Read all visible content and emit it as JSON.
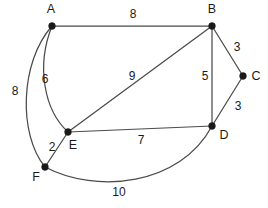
{
  "figure": {
    "type": "undirected-weighted-graph",
    "width": 268,
    "height": 208,
    "background_color": "#ffffff",
    "edge_color": "#4a4a4a",
    "node_color": "#1a1a1a",
    "label_color": "#1a1a1a"
  },
  "nodes": [
    {
      "id": "A",
      "label": "A",
      "cx": 52,
      "cy": 26,
      "label_x": 51,
      "label_y": 10
    },
    {
      "id": "B",
      "label": "B",
      "cx": 212,
      "cy": 26,
      "label_x": 212,
      "label_y": 10
    },
    {
      "id": "C",
      "label": "C",
      "cx": 243,
      "cy": 76,
      "label_x": 256,
      "label_y": 77
    },
    {
      "id": "D",
      "label": "D",
      "cx": 212,
      "cy": 126,
      "label_x": 224,
      "label_y": 136
    },
    {
      "id": "E",
      "label": "E",
      "cx": 68,
      "cy": 132,
      "label_x": 73,
      "label_y": 146
    },
    {
      "id": "F",
      "label": "F",
      "cx": 45,
      "cy": 167,
      "label_x": 36,
      "label_y": 178
    }
  ],
  "edges": [
    {
      "from": "A",
      "to": "B",
      "weight": "8",
      "shape": "straight",
      "path": "M 52 26 L 212 26",
      "label_x": 133,
      "label_y": 15
    },
    {
      "from": "A",
      "to": "E",
      "weight": "6",
      "shape": "curved",
      "path": "M 52 26 C 36 66, 44 110, 68 132",
      "label_x": 45,
      "label_y": 80
    },
    {
      "from": "A",
      "to": "F",
      "weight": "8",
      "shape": "curved",
      "path": "M 52 26 C 20 62, 18 134, 45 167",
      "label_x": 15,
      "label_y": 92
    },
    {
      "from": "B",
      "to": "C",
      "weight": "3",
      "shape": "straight",
      "path": "M 212 26 L 243 76",
      "label_x": 237,
      "label_y": 48
    },
    {
      "from": "B",
      "to": "D",
      "weight": "5",
      "shape": "straight",
      "path": "M 212 26 L 212 126",
      "label_x": 205,
      "label_y": 77
    },
    {
      "from": "B",
      "to": "E",
      "weight": "9",
      "shape": "straight",
      "path": "M 212 26 L 68 132",
      "label_x": 132,
      "label_y": 77
    },
    {
      "from": "C",
      "to": "D",
      "weight": "3",
      "shape": "straight",
      "path": "M 243 76 L 212 126",
      "label_x": 238,
      "label_y": 107
    },
    {
      "from": "E",
      "to": "D",
      "weight": "7",
      "shape": "straight",
      "path": "M 68 132 L 212 126",
      "label_x": 141,
      "label_y": 141
    },
    {
      "from": "E",
      "to": "F",
      "weight": "2",
      "shape": "straight",
      "path": "M 68 132 L 45 167",
      "label_x": 52,
      "label_y": 148
    },
    {
      "from": "F",
      "to": "D",
      "weight": "10",
      "shape": "curved",
      "path": "M 45 167 C 96 194, 180 186, 212 126",
      "label_x": 119,
      "label_y": 193
    }
  ]
}
